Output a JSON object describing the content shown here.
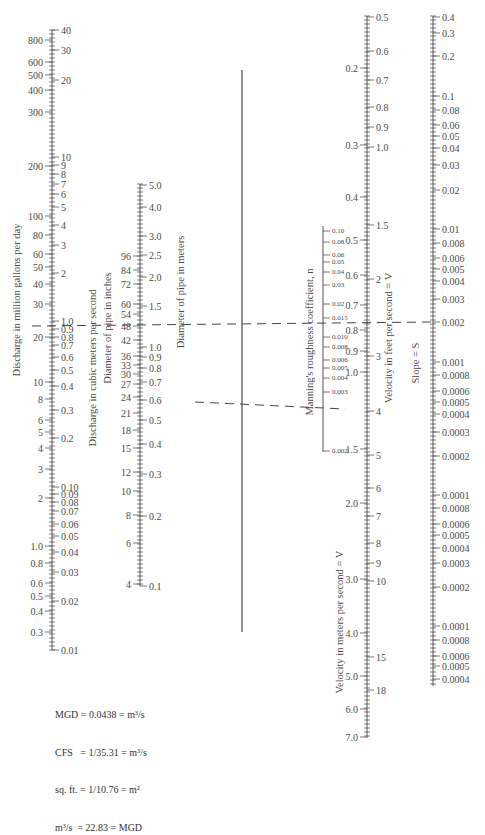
{
  "axes": {
    "discharge_mgd": {
      "label": "Discharge in million gallons per day",
      "x": 52,
      "top": 30,
      "bottom": 620,
      "side": "left",
      "ticks": [
        {
          "v": "800",
          "y": 40
        },
        {
          "v": "600",
          "y": 62
        },
        {
          "v": "500",
          "y": 75
        },
        {
          "v": "400",
          "y": 90
        },
        {
          "v": "300",
          "y": 112
        },
        {
          "v": "200",
          "y": 166
        },
        {
          "v": "100",
          "y": 216
        },
        {
          "v": "80",
          "y": 235
        },
        {
          "v": "60",
          "y": 254
        },
        {
          "v": "50",
          "y": 267
        },
        {
          "v": "40",
          "y": 284
        },
        {
          "v": "30",
          "y": 304
        },
        {
          "v": "20",
          "y": 337
        },
        {
          "v": "10",
          "y": 382
        },
        {
          "v": "8",
          "y": 399
        },
        {
          "v": "6",
          "y": 420
        },
        {
          "v": "5",
          "y": 432
        },
        {
          "v": "4",
          "y": 448
        },
        {
          "v": "3",
          "y": 469
        },
        {
          "v": "2",
          "y": 498
        },
        {
          "v": "1.0",
          "y": 546
        },
        {
          "v": "0.8",
          "y": 563
        },
        {
          "v": "0.6",
          "y": 583
        },
        {
          "v": "0.5",
          "y": 596
        },
        {
          "v": "0.4",
          "y": 611
        },
        {
          "v": "0.3",
          "y": 632
        }
      ]
    },
    "discharge_cms": {
      "label": "Discharge in cubic meters per second",
      "x": 52,
      "side": "right",
      "ticks": [
        {
          "v": "40",
          "y": 30
        },
        {
          "v": "30",
          "y": 50
        },
        {
          "v": "20",
          "y": 80
        },
        {
          "v": "10",
          "y": 157
        },
        {
          "v": "9",
          "y": 165
        },
        {
          "v": "8",
          "y": 174
        },
        {
          "v": "7",
          "y": 184
        },
        {
          "v": "6",
          "y": 194
        },
        {
          "v": "5",
          "y": 207
        },
        {
          "v": "4",
          "y": 225
        },
        {
          "v": "3",
          "y": 245
        },
        {
          "v": "2",
          "y": 273
        },
        {
          "v": "1.0",
          "y": 321
        },
        {
          "v": "0.9",
          "y": 329
        },
        {
          "v": "0.8",
          "y": 337
        },
        {
          "v": "0.7",
          "y": 345
        },
        {
          "v": "0.6",
          "y": 357
        },
        {
          "v": "0.5",
          "y": 370
        },
        {
          "v": "0.4",
          "y": 386
        },
        {
          "v": "0.3",
          "y": 410
        },
        {
          "v": "0.2",
          "y": 438
        },
        {
          "v": "0.10",
          "y": 487
        },
        {
          "v": "0.09",
          "y": 494
        },
        {
          "v": "0.08",
          "y": 502
        },
        {
          "v": "0.07",
          "y": 511
        },
        {
          "v": "0.06",
          "y": 524
        },
        {
          "v": "0.05",
          "y": 536
        },
        {
          "v": "0.04",
          "y": 552
        },
        {
          "v": "0.03",
          "y": 572
        },
        {
          "v": "0.02",
          "y": 601
        },
        {
          "v": "0.01",
          "y": 650
        }
      ]
    },
    "diameter_inches": {
      "label": "Diameter of pipe in inches",
      "x": 140,
      "side": "left",
      "ticks": [
        {
          "v": "96",
          "y": 256
        },
        {
          "v": "84",
          "y": 270
        },
        {
          "v": "72",
          "y": 284
        },
        {
          "v": "60",
          "y": 304
        },
        {
          "v": "54",
          "y": 314
        },
        {
          "v": "48",
          "y": 326
        },
        {
          "v": "42",
          "y": 340
        },
        {
          "v": "36",
          "y": 356
        },
        {
          "v": "33",
          "y": 365
        },
        {
          "v": "30",
          "y": 374
        },
        {
          "v": "27",
          "y": 384
        },
        {
          "v": "24",
          "y": 397
        },
        {
          "v": "21",
          "y": 413
        },
        {
          "v": "18",
          "y": 430
        },
        {
          "v": "15",
          "y": 448
        },
        {
          "v": "12",
          "y": 472
        },
        {
          "v": "10",
          "y": 491
        },
        {
          "v": "8",
          "y": 515
        },
        {
          "v": "6",
          "y": 543
        },
        {
          "v": "4",
          "y": 584
        }
      ]
    },
    "diameter_meters": {
      "label": "Diameter of pipe in meters",
      "x": 140,
      "top": 184,
      "bottom": 586,
      "side": "right",
      "ticks": [
        {
          "v": "5.0",
          "y": 185
        },
        {
          "v": "4.0",
          "y": 207
        },
        {
          "v": "3.0",
          "y": 236
        },
        {
          "v": "2.5",
          "y": 255
        },
        {
          "v": "2.0",
          "y": 277
        },
        {
          "v": "1.5",
          "y": 306
        },
        {
          "v": "1.0",
          "y": 347
        },
        {
          "v": "0.9",
          "y": 357
        },
        {
          "v": "0.8",
          "y": 368
        },
        {
          "v": "0.7",
          "y": 382
        },
        {
          "v": "0.6",
          "y": 400
        },
        {
          "v": "0.5",
          "y": 420
        },
        {
          "v": "0.4",
          "y": 444
        },
        {
          "v": "0.3",
          "y": 474
        },
        {
          "v": "0.2",
          "y": 516
        },
        {
          "v": "0.1",
          "y": 586
        }
      ]
    },
    "pivot_line": {
      "x": 242,
      "top": 70,
      "bottom": 632
    },
    "manning_n": {
      "label": "Manning's roughness coefficient, n",
      "x": 323,
      "top": 226,
      "bottom": 452,
      "side": "right",
      "ticks": [
        {
          "v": "0.10",
          "y": 231
        },
        {
          "v": "0.08",
          "y": 242
        },
        {
          "v": "0.06",
          "y": 255
        },
        {
          "v": "0.05",
          "y": 262
        },
        {
          "v": "0.04",
          "y": 272
        },
        {
          "v": "0.03",
          "y": 285
        },
        {
          "v": "0.02",
          "y": 304
        },
        {
          "v": "0.015",
          "y": 318
        },
        {
          "v": "0.010",
          "y": 337
        },
        {
          "v": "0.008",
          "y": 347
        },
        {
          "v": "0.006",
          "y": 360
        },
        {
          "v": "0.005",
          "y": 368
        },
        {
          "v": "0.004",
          "y": 378
        },
        {
          "v": "0.003",
          "y": 392
        },
        {
          "v": "0.002",
          "y": 451
        }
      ]
    },
    "velocity_mps": {
      "label": "Velocity in meters per second = V",
      "x": 367,
      "top": 16,
      "bottom": 738,
      "side": "left",
      "ticks": [
        {
          "v": "0.2",
          "y": 68
        },
        {
          "v": "0.3",
          "y": 145
        },
        {
          "v": "0.4",
          "y": 197
        },
        {
          "v": "0.5",
          "y": 240
        },
        {
          "v": "0.6",
          "y": 275
        },
        {
          "v": "0.7",
          "y": 305
        },
        {
          "v": "0.8",
          "y": 330
        },
        {
          "v": "0.9",
          "y": 351
        },
        {
          "v": "1.0",
          "y": 372
        },
        {
          "v": "1.5",
          "y": 449
        },
        {
          "v": "2.0",
          "y": 503
        },
        {
          "v": "3.0",
          "y": 579
        },
        {
          "v": "4.0",
          "y": 633
        },
        {
          "v": "5.0",
          "y": 676
        },
        {
          "v": "6.0",
          "y": 709
        },
        {
          "v": "7.0",
          "y": 737
        }
      ]
    },
    "velocity_fps": {
      "label": "Velocity in feet per second = V",
      "x": 367,
      "side": "right",
      "ticks": [
        {
          "v": "0.5",
          "y": 17
        },
        {
          "v": "0.6",
          "y": 51
        },
        {
          "v": "0.7",
          "y": 80
        },
        {
          "v": "0.8",
          "y": 107
        },
        {
          "v": "0.9",
          "y": 127
        },
        {
          "v": "1.0",
          "y": 147
        },
        {
          "v": "1.5",
          "y": 225
        },
        {
          "v": "2",
          "y": 279
        },
        {
          "v": "3",
          "y": 356
        },
        {
          "v": "4",
          "y": 411
        },
        {
          "v": "5",
          "y": 455
        },
        {
          "v": "6",
          "y": 488
        },
        {
          "v": "7",
          "y": 516
        },
        {
          "v": "8",
          "y": 543
        },
        {
          "v": "9",
          "y": 563
        },
        {
          "v": "10",
          "y": 581
        },
        {
          "v": "15",
          "y": 657
        },
        {
          "v": "18",
          "y": 690
        }
      ]
    },
    "slope": {
      "label": "Slope = S",
      "x": 433,
      "top": 16,
      "bottom": 686,
      "side": "right",
      "ticks": [
        {
          "v": "0.4",
          "y": 17
        },
        {
          "v": "0.3",
          "y": 33
        },
        {
          "v": "0.2",
          "y": 56
        },
        {
          "v": "0.1",
          "y": 96
        },
        {
          "v": "0.08",
          "y": 110
        },
        {
          "v": "0.06",
          "y": 125
        },
        {
          "v": "0.05",
          "y": 136
        },
        {
          "v": "0.04",
          "y": 148
        },
        {
          "v": "0.03",
          "y": 165
        },
        {
          "v": "0.02",
          "y": 190
        },
        {
          "v": "0.01",
          "y": 229
        },
        {
          "v": "0.008",
          "y": 243
        },
        {
          "v": "0.006",
          "y": 258
        },
        {
          "v": "0.005",
          "y": 269
        },
        {
          "v": "0.004",
          "y": 281
        },
        {
          "v": "0.003",
          "y": 299
        },
        {
          "v": "0.002",
          "y": 322
        },
        {
          "v": "0.001",
          "y": 362
        },
        {
          "v": "0.0008",
          "y": 375
        },
        {
          "v": "0.0006",
          "y": 391
        },
        {
          "v": "0.0005",
          "y": 402
        },
        {
          "v": "0.0004",
          "y": 414
        },
        {
          "v": "0.0003",
          "y": 432
        },
        {
          "v": "0.0002",
          "y": 456
        },
        {
          "v": "0.0001",
          "y": 495
        },
        {
          "v": "0.0008",
          "y": 508
        },
        {
          "v": "0.0006",
          "y": 524
        },
        {
          "v": "0.0005",
          "y": 535
        },
        {
          "v": "0.0004",
          "y": 548
        },
        {
          "v": "0.0003",
          "y": 563
        },
        {
          "v": "0.0002",
          "y": 587
        },
        {
          "v": "0.0001",
          "y": 626
        },
        {
          "v": "0.0008",
          "y": 640
        },
        {
          "v": "0.0006",
          "y": 656
        },
        {
          "v": "0.0005",
          "y": 666
        },
        {
          "v": "0.0004",
          "y": 679
        }
      ]
    }
  },
  "example_lines": [
    {
      "from": [
        32,
        326
      ],
      "to": [
        432,
        322
      ]
    },
    {
      "from": [
        195,
        402
      ],
      "to": [
        345,
        409
      ]
    }
  ],
  "conversions": [
    {
      "lhs": "MGD",
      "eq1": "= 0.0438 =",
      "rhs": "m³/s"
    },
    {
      "lhs": "CFS",
      "eq1": "   = 1/35.31 =",
      "rhs": "m³/s"
    },
    {
      "lhs": "sq. ft.",
      "eq1": " = 1/10.76 =",
      "rhs": "m²"
    },
    {
      "lhs": "m³/s",
      "eq1": "  = 22.83 =",
      "rhs": "MGD"
    }
  ]
}
